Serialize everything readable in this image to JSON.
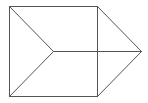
{
  "diagram": {
    "type": "wireframe-shape",
    "canvas": {
      "width": 148,
      "height": 103,
      "background": "#ffffff"
    },
    "stroke_color": "#555555",
    "points": {
      "top_left": [
        9,
        6
      ],
      "top_right": [
        97,
        6
      ],
      "bottom_left": [
        9,
        96
      ],
      "bottom_right": [
        97,
        96
      ],
      "center": [
        53,
        51
      ],
      "apex": [
        141,
        51
      ]
    },
    "edges": [
      {
        "id": "top",
        "from": "top_left",
        "to": "top_right"
      },
      {
        "id": "left",
        "from": "top_left",
        "to": "bottom_left"
      },
      {
        "id": "bottom",
        "from": "bottom_left",
        "to": "bottom_right"
      },
      {
        "id": "right-vertical",
        "from": "top_right",
        "to": "bottom_right"
      },
      {
        "id": "diag-upper",
        "from": "top_left",
        "to": "center"
      },
      {
        "id": "diag-lower",
        "from": "bottom_left",
        "to": "center"
      },
      {
        "id": "horizontal-mid",
        "from": "center",
        "to": "apex"
      },
      {
        "id": "apex-upper",
        "from": "top_right",
        "to": "apex"
      },
      {
        "id": "apex-lower",
        "from": "bottom_right",
        "to": "apex"
      }
    ]
  }
}
